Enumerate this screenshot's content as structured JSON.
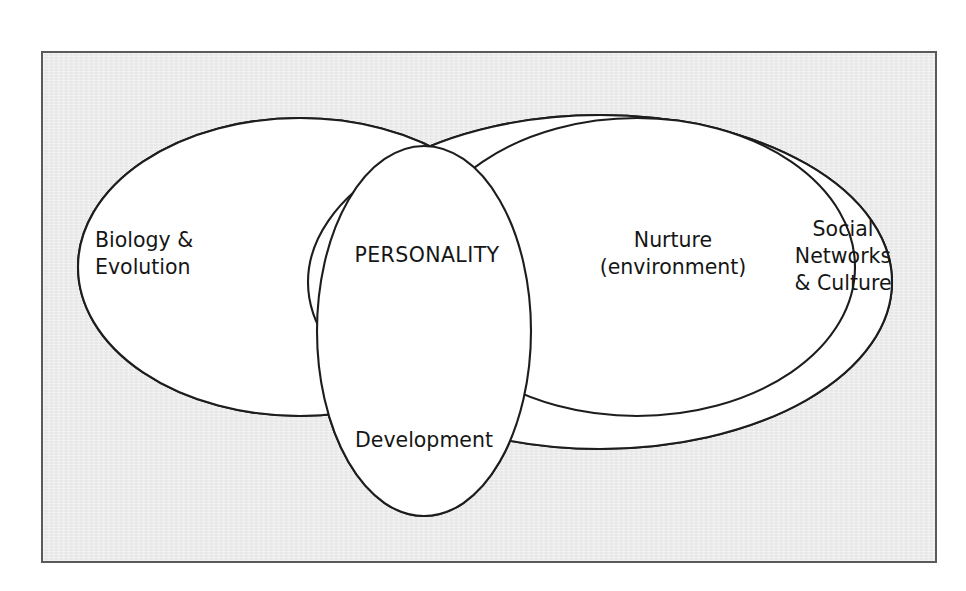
{
  "diagram": {
    "title_caption": "",
    "frame": {
      "background_color": "#ededed",
      "border_color": "#5a5a5a",
      "outside_color": "#ffffff"
    },
    "style": {
      "ellipse_fill": "#ffffff",
      "ellipse_stroke": "#1d1d1d",
      "text_color": "#161616"
    },
    "regions": [
      {
        "id": "biology-evolution",
        "lines": [
          "Biology &",
          "Evolution"
        ],
        "align": "start"
      },
      {
        "id": "personality",
        "lines": [
          "PERSONALITY"
        ],
        "align": "center"
      },
      {
        "id": "nurture-environment",
        "lines": [
          "Nurture",
          "(environment)"
        ],
        "align": "center"
      },
      {
        "id": "social-networks-culture",
        "lines": [
          "Social",
          "Networks",
          "& Culture"
        ],
        "align": "center"
      },
      {
        "id": "development",
        "lines": [
          "Development"
        ],
        "align": "center"
      }
    ],
    "ellipses": [
      {
        "id": "biology-evolution-ellipse",
        "cx": 300,
        "cy": 267,
        "rx": 222,
        "ry": 149,
        "rotate": 0
      },
      {
        "id": "nurture-ellipse",
        "cx": 637,
        "cy": 267,
        "rx": 218,
        "ry": 149,
        "rotate": 0
      },
      {
        "id": "social-culture-ellipse",
        "cx": 600,
        "cy": 282,
        "rx": 292,
        "ry": 167,
        "rotate": 0
      },
      {
        "id": "development-ellipse",
        "cx": 424,
        "cy": 331,
        "rx": 107,
        "ry": 185,
        "rotate": 0
      }
    ]
  },
  "labels": {
    "biology_line1": "Biology &",
    "biology_line2": "Evolution",
    "personality": "PERSONALITY",
    "nurture_line1": "Nurture",
    "nurture_line2": "(environment)",
    "social_line1": "Social",
    "social_line2": "Networks",
    "social_line3": "& Culture",
    "development": "Development"
  }
}
